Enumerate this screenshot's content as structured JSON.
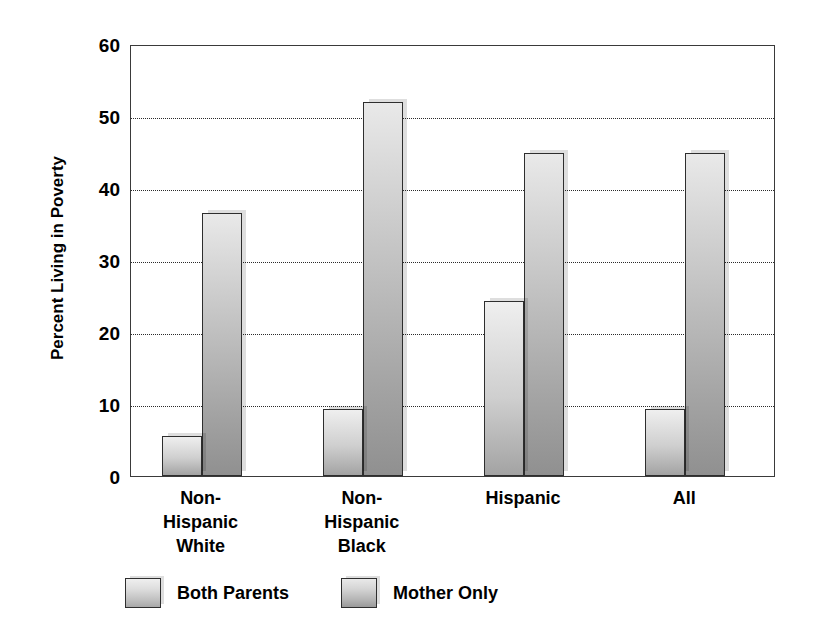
{
  "chart_data": {
    "type": "bar",
    "title": "",
    "subtitle": "",
    "xlabel": "",
    "ylabel": "Percent Living in Poverty",
    "ylim": [
      0,
      60
    ],
    "ytick_step": 10,
    "yticks": [
      60,
      50,
      40,
      30,
      20,
      10,
      0
    ],
    "ytick_labels": [
      "60",
      "50",
      "40",
      "30",
      "20",
      "10",
      "0"
    ],
    "grid": "horizontal-dotted",
    "legend_position": "bottom",
    "categories": [
      "Non-\nHispanic\nWhite",
      "Non-\nHispanic\nBlack",
      "Hispanic",
      "All"
    ],
    "category_labels_flat": [
      "Non-Hispanic White",
      "Non-Hispanic Black",
      "Hispanic",
      "All"
    ],
    "series": [
      {
        "name": "Both Parents",
        "color": "#c9c9c9",
        "values": [
          5.6,
          9.3,
          24.3,
          9.3
        ]
      },
      {
        "name": "Mother Only",
        "color": "#b0b0b0",
        "values": [
          36.5,
          52.0,
          44.9,
          44.9
        ]
      }
    ]
  },
  "axis": {
    "y_title": "Percent Living in Poverty"
  },
  "legend": {
    "items": [
      {
        "label": "Both Parents",
        "swatch": "both"
      },
      {
        "label": "Mother Only",
        "swatch": "mother"
      }
    ]
  }
}
